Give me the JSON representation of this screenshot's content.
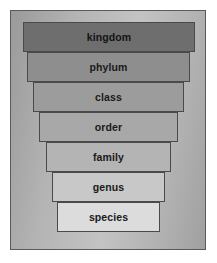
{
  "figure": {
    "frame_border_color": "#5a5a5a",
    "plate_color": "#b4b4b4"
  },
  "chart_data": {
    "type": "bar",
    "orientation": "funnel",
    "xlabel": "",
    "ylabel": "",
    "categories": [
      "kingdom",
      "phylum",
      "class",
      "order",
      "family",
      "genus",
      "species"
    ],
    "values": [
      7,
      6,
      5,
      4,
      3,
      2,
      1
    ],
    "value_meaning": "relative width of each taxonomic rank band (widest = broadest rank)",
    "legend": "none",
    "grid": false
  },
  "levels": [
    {
      "label": "kingbind",
      "name": "kingdom",
      "rank": 1,
      "left": 12,
      "top": 11,
      "width": 172,
      "height": 30,
      "fill": "#6e6e6e"
    },
    {
      "name": "phylum",
      "rank": 2,
      "left": 16,
      "top": 41,
      "width": 163,
      "height": 30,
      "fill": "#8e8e8e"
    },
    {
      "name": "class",
      "rank": 3,
      "left": 22,
      "top": 71,
      "width": 151,
      "height": 30,
      "fill": "#9c9c9c"
    },
    {
      "name": "order",
      "rank": 4,
      "left": 28,
      "top": 101,
      "width": 139,
      "height": 30,
      "fill": "#a8a8a8"
    },
    {
      "name": "family",
      "rank": 5,
      "left": 35,
      "top": 131,
      "width": 125,
      "height": 30,
      "fill": "#b4b4b4"
    },
    {
      "name": "genus",
      "rank": 6,
      "left": 41,
      "top": 161,
      "width": 113,
      "height": 30,
      "fill": "#c8c8c8"
    },
    {
      "name": "species",
      "rank": 7,
      "left": 46,
      "top": 191,
      "width": 103,
      "height": 30,
      "fill": "#dcdcdc"
    }
  ]
}
